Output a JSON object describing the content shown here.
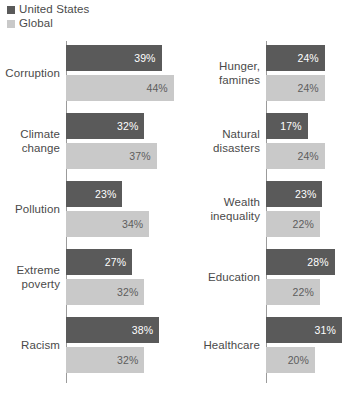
{
  "legend": {
    "items": [
      {
        "label": "United States",
        "color": "#5a5a5a",
        "swatch_name": "legend-swatch-united-states"
      },
      {
        "label": "Global",
        "color": "#c9c9c9",
        "swatch_name": "legend-swatch-global"
      }
    ]
  },
  "chart_data": {
    "type": "bar",
    "orientation": "horizontal",
    "title": "",
    "subtitle": "",
    "xlabel": "",
    "ylabel": "",
    "grid": false,
    "legend_position": "top-left",
    "value_suffix": "%",
    "xlim": [
      0,
      44
    ],
    "px_per_unit": 2.45,
    "series": [
      {
        "name": "United States",
        "color": "#5a5a5a"
      },
      {
        "name": "Global",
        "color": "#c9c9c9"
      }
    ],
    "panels": [
      {
        "name": "left",
        "categories": [
          "Corruption",
          "Climate change",
          "Pollution",
          "Extreme poverty",
          "Racism"
        ],
        "groups": [
          {
            "category": "Corruption",
            "label_lines": [
              "Corruption"
            ],
            "us": 39,
            "global": 44,
            "us_text": "39%",
            "global_text": "44%"
          },
          {
            "category": "Climate change",
            "label_lines": [
              "Climate",
              "change"
            ],
            "us": 32,
            "global": 37,
            "us_text": "32%",
            "global_text": "37%"
          },
          {
            "category": "Pollution",
            "label_lines": [
              "Pollution"
            ],
            "us": 23,
            "global": 34,
            "us_text": "23%",
            "global_text": "34%"
          },
          {
            "category": "Extreme poverty",
            "label_lines": [
              "Extreme",
              "poverty"
            ],
            "us": 27,
            "global": 32,
            "us_text": "27%",
            "global_text": "32%"
          },
          {
            "category": "Racism",
            "label_lines": [
              "Racism"
            ],
            "us": 38,
            "global": 32,
            "us_text": "38%",
            "global_text": "32%"
          }
        ]
      },
      {
        "name": "right",
        "categories": [
          "Hunger, famines",
          "Natural disasters",
          "Wealth inequality",
          "Education",
          "Healthcare"
        ],
        "groups": [
          {
            "category": "Hunger, famines",
            "label_lines": [
              "Hunger,",
              "famines"
            ],
            "us": 24,
            "global": 24,
            "us_text": "24%",
            "global_text": "24%"
          },
          {
            "category": "Natural disasters",
            "label_lines": [
              "Natural",
              "disasters"
            ],
            "us": 17,
            "global": 24,
            "us_text": "17%",
            "global_text": "24%"
          },
          {
            "category": "Wealth inequality",
            "label_lines": [
              "Wealth",
              "inequality"
            ],
            "us": 23,
            "global": 22,
            "us_text": "23%",
            "global_text": "22%"
          },
          {
            "category": "Education",
            "label_lines": [
              "Education"
            ],
            "us": 28,
            "global": 22,
            "us_text": "28%",
            "global_text": "22%"
          },
          {
            "category": "Healthcare",
            "label_lines": [
              "Healthcare"
            ],
            "us": 31,
            "global": 20,
            "us_text": "31%",
            "global_text": "20%"
          }
        ]
      }
    ]
  }
}
